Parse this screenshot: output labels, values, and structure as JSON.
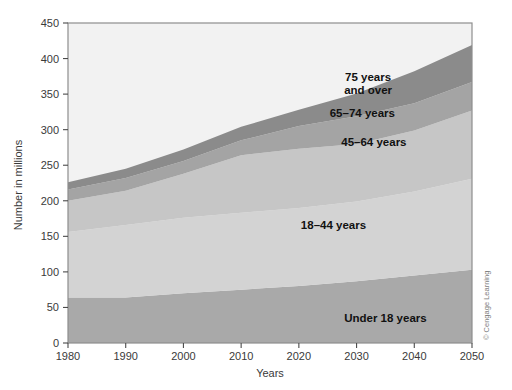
{
  "chart_data": {
    "type": "area",
    "stacked": true,
    "title": "",
    "xlabel": "Years",
    "ylabel": "Number in millions",
    "x": [
      1980,
      1990,
      2000,
      2010,
      2020,
      2030,
      2040,
      2050
    ],
    "xlim": [
      1980,
      2050
    ],
    "ylim": [
      0,
      450
    ],
    "xticks": [
      1980,
      1990,
      2000,
      2010,
      2020,
      2030,
      2040,
      2050
    ],
    "yticks": [
      0,
      50,
      100,
      150,
      200,
      250,
      300,
      350,
      400,
      450
    ],
    "grid": false,
    "legend": "inline-labels",
    "series": [
      {
        "name": "Under 18 years",
        "color": "#a9a9a9",
        "label": "Under 18 years",
        "label_x": 2035,
        "label_y": 30,
        "values": [
          64,
          64,
          70,
          75,
          80,
          87,
          95,
          103
        ]
      },
      {
        "name": "18–44 years",
        "color": "#d3d3d3",
        "label": "18–44 years",
        "label_x": 2026,
        "label_y": 160,
        "values": [
          92,
          102,
          106,
          108,
          110,
          112,
          118,
          128
        ]
      },
      {
        "name": "45–64 years",
        "color": "#c6c6c6",
        "label": "45–64 years",
        "label_x": 2033,
        "label_y": 277,
        "values": [
          44,
          48,
          62,
          81,
          83,
          81,
          86,
          96
        ]
      },
      {
        "name": "65–74 years",
        "color": "#a4a4a4",
        "label": "65–74 years",
        "label_x": 2031,
        "label_y": 318,
        "values": [
          16,
          18,
          18,
          21,
          32,
          39,
          38,
          40
        ]
      },
      {
        "name": "75 years and over",
        "color": "#8b8b8b",
        "label_line1": "75 years",
        "label_line2": "and over",
        "label_x": 2032,
        "label_y": 368,
        "values": [
          10,
          13,
          16,
          19,
          23,
          32,
          45,
          52
        ]
      }
    ],
    "plot_background": "#f2f2f2",
    "frame_color": "#8e8e8e"
  },
  "credit": {
    "text": "© Cengage Learning"
  }
}
